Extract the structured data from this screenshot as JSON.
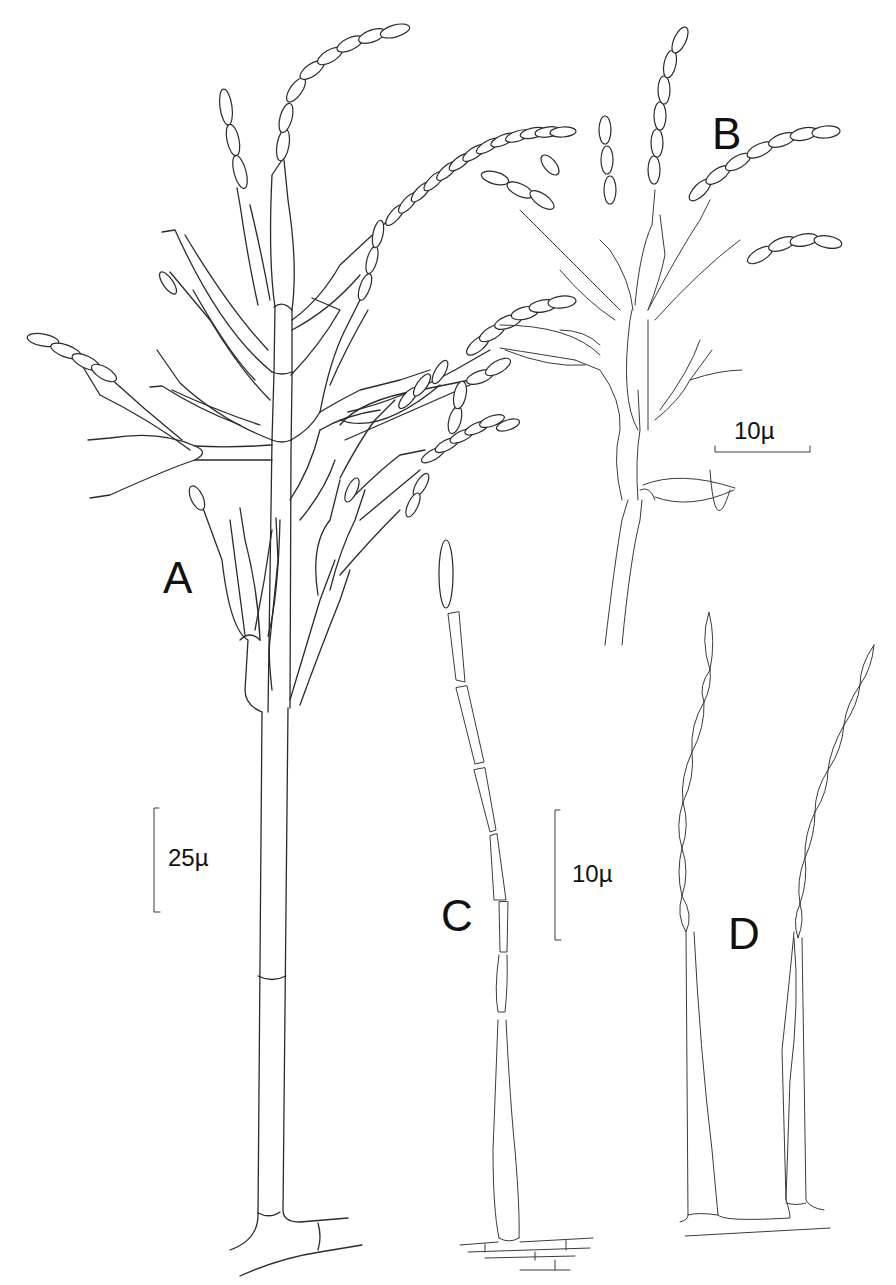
{
  "figure": {
    "panels": [
      {
        "id": "A",
        "label": "A"
      },
      {
        "id": "B",
        "label": "B"
      },
      {
        "id": "C",
        "label": "C"
      },
      {
        "id": "D",
        "label": "D"
      }
    ],
    "scale_bars": [
      {
        "id": "scale-a",
        "label": "25µ",
        "orientation": "vertical"
      },
      {
        "id": "scale-b",
        "label": "10µ",
        "orientation": "horizontal"
      },
      {
        "id": "scale-cd",
        "label": "10µ",
        "orientation": "vertical"
      }
    ],
    "colors": {
      "line": "#2a2a2a",
      "background": "#ffffff"
    }
  }
}
